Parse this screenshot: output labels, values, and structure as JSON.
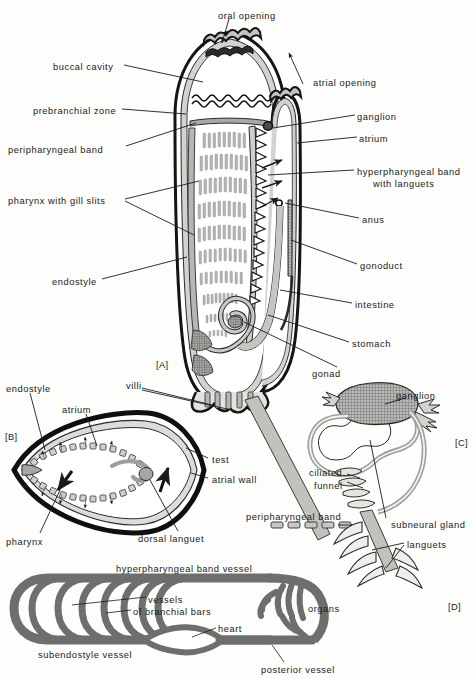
{
  "figure": {
    "background_color": "#fdfdfc",
    "ink_color": "#1b1b1b",
    "tissue_fill": "#c9c9c7",
    "lumen_fill": "#ffffff",
    "vessel_fill": "#6e6e6c",
    "hatch_fill": "#8a8a88"
  },
  "panels": [
    {
      "id": "A",
      "tag": "[A]",
      "caption": "whole animal, longitudinal section"
    },
    {
      "id": "B",
      "tag": "[B]",
      "caption": "transverse section through pharynx"
    },
    {
      "id": "C",
      "tag": "[C]",
      "caption": "ganglion and subneural gland"
    },
    {
      "id": "D",
      "tag": "[D]",
      "caption": "circulatory system plan"
    }
  ],
  "panel_a": {
    "tag": "[A]",
    "labels": [
      {
        "name": "oral-opening",
        "text": "oral opening",
        "x": 218,
        "y": 11,
        "align": "left"
      },
      {
        "name": "buccal-cavity",
        "text": "buccal cavity",
        "x": 53,
        "y": 62,
        "align": "left"
      },
      {
        "name": "prebranchial-zone",
        "text": "prebranchial zone",
        "x": 33,
        "y": 106,
        "align": "left"
      },
      {
        "name": "peripharyngeal-band",
        "text": "peripharyngeal band",
        "x": 8,
        "y": 145,
        "align": "left"
      },
      {
        "name": "pharynx-with-gill-slits",
        "text": "pharynx with gill slits",
        "x": 8,
        "y": 196,
        "align": "left"
      },
      {
        "name": "endostyle",
        "text": "endostyle",
        "x": 52,
        "y": 277,
        "align": "left"
      },
      {
        "name": "villi",
        "text": "villi",
        "x": 126,
        "y": 381,
        "align": "left"
      },
      {
        "name": "atrial-opening",
        "text": "atrial opening",
        "x": 313,
        "y": 78,
        "align": "left"
      },
      {
        "name": "ganglion",
        "text": "ganglion",
        "x": 357,
        "y": 112,
        "align": "left"
      },
      {
        "name": "atrium",
        "text": "atrium",
        "x": 359,
        "y": 134,
        "align": "left"
      },
      {
        "name": "hyperpharyngeal-band",
        "text": "hyperpharyngeal band",
        "x": 357,
        "y": 167,
        "align": "left"
      },
      {
        "name": "hyperpharyngeal-band-2",
        "text": "with languets",
        "x": 373,
        "y": 179,
        "align": "left"
      },
      {
        "name": "anus",
        "text": "anus",
        "x": 362,
        "y": 215,
        "align": "left"
      },
      {
        "name": "gonoduct",
        "text": "gonoduct",
        "x": 360,
        "y": 261,
        "align": "left"
      },
      {
        "name": "intestine",
        "text": "intestine",
        "x": 355,
        "y": 300,
        "align": "left"
      },
      {
        "name": "stomach",
        "text": "stomach",
        "x": 352,
        "y": 339,
        "align": "left"
      },
      {
        "name": "gonad",
        "text": "gonad",
        "x": 312,
        "y": 369,
        "align": "left"
      }
    ]
  },
  "panel_b": {
    "tag": "[B]",
    "labels": [
      {
        "name": "endostyle",
        "text": "endostyle",
        "x": 6,
        "y": 384,
        "align": "left"
      },
      {
        "name": "atrium",
        "text": "atrium",
        "x": 62,
        "y": 405,
        "align": "left"
      },
      {
        "name": "test",
        "text": "test",
        "x": 212,
        "y": 455,
        "align": "left"
      },
      {
        "name": "atrial-wall",
        "text": "atrial wall",
        "x": 212,
        "y": 475,
        "align": "left"
      },
      {
        "name": "pharynx",
        "text": "pharynx",
        "x": 6,
        "y": 537,
        "align": "left"
      },
      {
        "name": "dorsal-languet",
        "text": "dorsal languet",
        "x": 138,
        "y": 534,
        "align": "left"
      }
    ]
  },
  "panel_c": {
    "tag": "[C]",
    "labels": [
      {
        "name": "ganglion",
        "text": "ganglion",
        "x": 396,
        "y": 391,
        "align": "left"
      },
      {
        "name": "ciliated-funnel",
        "text": "ciliated",
        "x": 309,
        "y": 468,
        "align": "left"
      },
      {
        "name": "ciliated-funnel-2",
        "text": "funnel",
        "x": 314,
        "y": 481,
        "align": "left"
      },
      {
        "name": "peripharyngeal-band",
        "text": "peripharyngeal band",
        "x": 246,
        "y": 512,
        "align": "left"
      },
      {
        "name": "subneural-gland",
        "text": "subneural gland",
        "x": 391,
        "y": 520,
        "align": "left"
      },
      {
        "name": "languets",
        "text": "languets",
        "x": 407,
        "y": 540,
        "align": "left"
      }
    ]
  },
  "panel_d": {
    "tag": "[D]",
    "labels": [
      {
        "name": "hyperpharyngeal-band-vessel",
        "text": "hyperpharyngeal band vessel",
        "x": 116,
        "y": 564,
        "align": "left"
      },
      {
        "name": "vessels-of-branchial-bars",
        "text": "vessels",
        "x": 148,
        "y": 595,
        "align": "left"
      },
      {
        "name": "vessels-of-branchial-bars-2",
        "text": "of branchial bars",
        "x": 133,
        "y": 607,
        "align": "left"
      },
      {
        "name": "organs",
        "text": "organs",
        "x": 308,
        "y": 604,
        "align": "left"
      },
      {
        "name": "heart",
        "text": "heart",
        "x": 218,
        "y": 624,
        "align": "left"
      },
      {
        "name": "subendostyle-vessel",
        "text": "subendostyle vessel",
        "x": 38,
        "y": 650,
        "align": "left"
      },
      {
        "name": "posterior-vessel",
        "text": "posterior vessel",
        "x": 261,
        "y": 665,
        "align": "left"
      }
    ]
  },
  "panel_tags": [
    {
      "name": "panel-tag-a",
      "text": "[A]",
      "x": 156,
      "y": 360
    },
    {
      "name": "panel-tag-b",
      "text": "[B]",
      "x": 5,
      "y": 432
    },
    {
      "name": "panel-tag-c",
      "text": "[C]",
      "x": 455,
      "y": 438
    },
    {
      "name": "panel-tag-d",
      "text": "[D]",
      "x": 448,
      "y": 602
    }
  ]
}
